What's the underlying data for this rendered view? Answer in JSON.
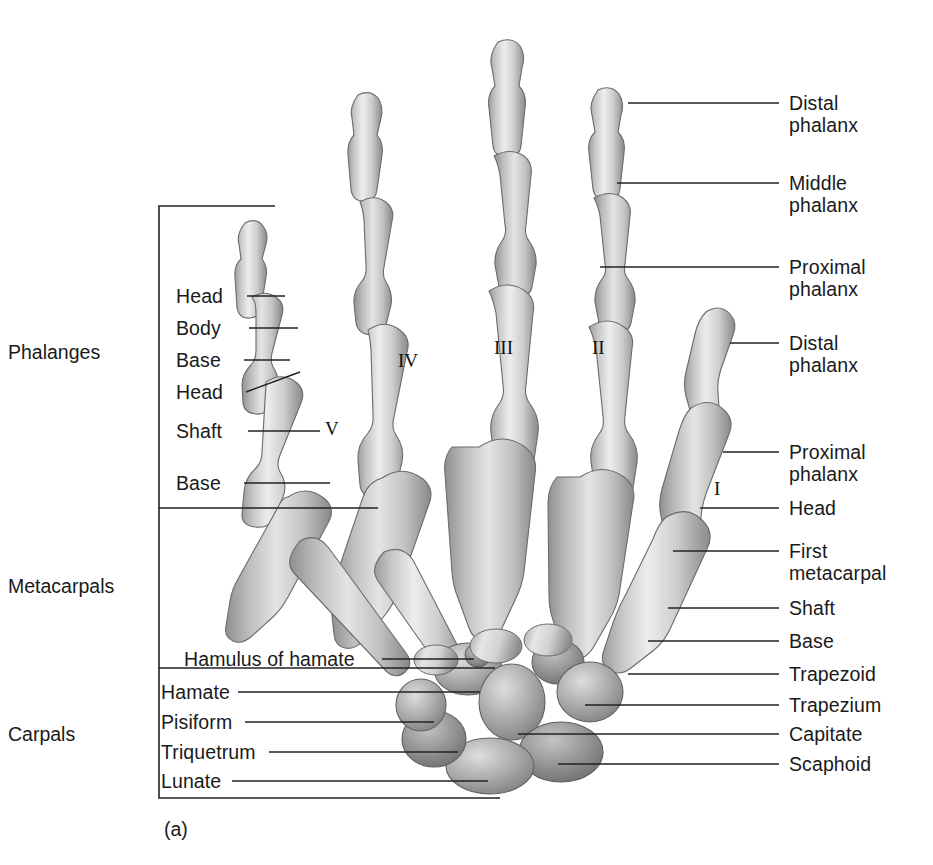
{
  "figure": {
    "caption": "(a)"
  },
  "group_labels": [
    {
      "id": "phalanges",
      "text": "Phalanges",
      "x": 8,
      "y": 341
    },
    {
      "id": "metacarpals",
      "text": "Metacarpals",
      "x": 8,
      "y": 575
    },
    {
      "id": "carpals",
      "text": "Carpals",
      "x": 8,
      "y": 723
    }
  ],
  "left_labels": [
    {
      "id": "head-distal",
      "text": "Head",
      "x": 176,
      "y": 285,
      "line": {
        "x1": 247,
        "y1": 296,
        "x2": 285,
        "y2": 296
      }
    },
    {
      "id": "body-distal",
      "text": "Body",
      "x": 176,
      "y": 317,
      "line": {
        "x1": 249,
        "y1": 328,
        "x2": 298,
        "y2": 328
      }
    },
    {
      "id": "base-distal",
      "text": "Base",
      "x": 176,
      "y": 349,
      "line": {
        "x1": 244,
        "y1": 360,
        "x2": 290,
        "y2": 360
      }
    },
    {
      "id": "head-meta5",
      "text": "Head",
      "x": 176,
      "y": 381,
      "line": {
        "x1": 246,
        "y1": 392,
        "x2": 300,
        "y2": 372
      }
    },
    {
      "id": "shaft-meta5",
      "text": "Shaft",
      "x": 176,
      "y": 420,
      "line": {
        "x1": 248,
        "y1": 431,
        "x2": 320,
        "y2": 431
      }
    },
    {
      "id": "base-meta5",
      "text": "Base",
      "x": 176,
      "y": 472,
      "line": {
        "x1": 244,
        "y1": 483,
        "x2": 330,
        "y2": 483
      }
    },
    {
      "id": "hamulus",
      "text": "Hamulus of hamate",
      "x": 184,
      "y": 648,
      "line": {
        "x1": 382,
        "y1": 659,
        "x2": 474,
        "y2": 659
      }
    },
    {
      "id": "hamate",
      "text": "Hamate",
      "x": 161,
      "y": 681,
      "line": {
        "x1": 238,
        "y1": 692,
        "x2": 480,
        "y2": 692
      }
    },
    {
      "id": "pisiform",
      "text": "Pisiform",
      "x": 161,
      "y": 711,
      "line": {
        "x1": 245,
        "y1": 722,
        "x2": 434,
        "y2": 722
      }
    },
    {
      "id": "triquetrum",
      "text": "Triquetrum",
      "x": 161,
      "y": 741,
      "line": {
        "x1": 269,
        "y1": 752,
        "x2": 458,
        "y2": 752
      }
    },
    {
      "id": "lunate",
      "text": "Lunate",
      "x": 161,
      "y": 770,
      "line": {
        "x1": 232,
        "y1": 781,
        "x2": 488,
        "y2": 781
      }
    }
  ],
  "right_labels": [
    {
      "id": "distal-phalanx-3",
      "text": "Distal\nphalanx",
      "x": 789,
      "y": 92,
      "line": {
        "x1": 628,
        "y1": 103,
        "x2": 779,
        "y2": 103
      }
    },
    {
      "id": "middle-phalanx-3",
      "text": "Middle\nphalanx",
      "x": 789,
      "y": 172,
      "line": {
        "x1": 617,
        "y1": 183,
        "x2": 779,
        "y2": 183
      }
    },
    {
      "id": "proximal-phalanx-3",
      "text": "Proximal\nphalanx",
      "x": 789,
      "y": 256,
      "line": {
        "x1": 600,
        "y1": 267,
        "x2": 779,
        "y2": 267
      }
    },
    {
      "id": "distal-phalanx-1",
      "text": "Distal\nphalanx",
      "x": 789,
      "y": 332,
      "line": {
        "x1": 730,
        "y1": 343,
        "x2": 779,
        "y2": 343
      }
    },
    {
      "id": "proximal-phalanx-1",
      "text": "Proximal\nphalanx",
      "x": 789,
      "y": 441,
      "line": {
        "x1": 723,
        "y1": 452,
        "x2": 779,
        "y2": 452
      }
    },
    {
      "id": "head-meta1",
      "text": "Head",
      "x": 789,
      "y": 497,
      "line": {
        "x1": 700,
        "y1": 508,
        "x2": 779,
        "y2": 508
      }
    },
    {
      "id": "first-metacarpal",
      "text": "First\nmetacarpal",
      "x": 789,
      "y": 540,
      "line": {
        "x1": 673,
        "y1": 551,
        "x2": 779,
        "y2": 551
      }
    },
    {
      "id": "shaft-meta1",
      "text": "Shaft",
      "x": 789,
      "y": 597,
      "line": {
        "x1": 668,
        "y1": 608,
        "x2": 779,
        "y2": 608
      }
    },
    {
      "id": "base-meta1",
      "text": "Base",
      "x": 789,
      "y": 630,
      "line": {
        "x1": 648,
        "y1": 641,
        "x2": 779,
        "y2": 641
      }
    },
    {
      "id": "trapezoid",
      "text": "Trapezoid",
      "x": 789,
      "y": 663,
      "line": {
        "x1": 628,
        "y1": 674,
        "x2": 779,
        "y2": 674
      }
    },
    {
      "id": "trapezium",
      "text": "Trapezium",
      "x": 789,
      "y": 694,
      "line": {
        "x1": 585,
        "y1": 705,
        "x2": 779,
        "y2": 705
      }
    },
    {
      "id": "capitate",
      "text": "Capitate",
      "x": 789,
      "y": 723,
      "line": {
        "x1": 518,
        "y1": 734,
        "x2": 779,
        "y2": 734
      }
    },
    {
      "id": "scaphoid",
      "text": "Scaphoid",
      "x": 789,
      "y": 753,
      "line": {
        "x1": 558,
        "y1": 764,
        "x2": 779,
        "y2": 764
      }
    }
  ],
  "roman_numerals": [
    {
      "id": "digit-1",
      "text": "I",
      "x": 714,
      "y": 478
    },
    {
      "id": "digit-2",
      "text": "II",
      "x": 592,
      "y": 337
    },
    {
      "id": "digit-3",
      "text": "III",
      "x": 494,
      "y": 337
    },
    {
      "id": "digit-4",
      "text": "IV",
      "x": 398,
      "y": 350
    },
    {
      "id": "digit-5",
      "text": "V",
      "x": 325,
      "y": 418
    }
  ],
  "brackets": {
    "phalanges": {
      "x": 159,
      "top": 206,
      "bottom": 508,
      "tick_right": 275
    },
    "metacarpals": {
      "x": 159,
      "top": 508,
      "bottom": 668,
      "tick_right": 378
    },
    "carpals": {
      "x": 159,
      "top": 668,
      "bottom": 798,
      "tick_right": 495
    }
  },
  "colors": {
    "bone_light": "#e8e8e8",
    "bone_mid": "#b8b8b8",
    "bone_dark": "#8a8a8a",
    "bone_shadow": "#6f6f6f",
    "line": "#222222",
    "text": "#1a1a1a",
    "background": "#ffffff"
  }
}
